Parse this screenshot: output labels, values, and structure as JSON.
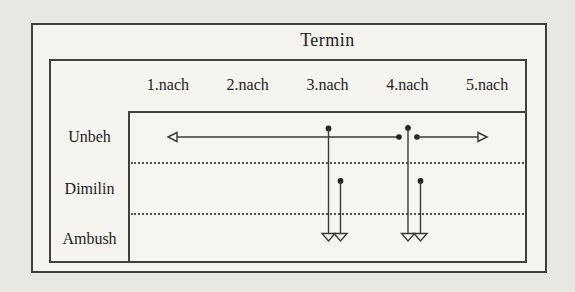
{
  "figure": {
    "title": "Termin",
    "columns": [
      "1.nach",
      "2.nach",
      "3.nach",
      "4.nach",
      "5.nach"
    ],
    "rows": [
      "Unbeh",
      "Dimilin",
      "Ambush"
    ]
  },
  "colors": {
    "line": "#3c3a38",
    "dot": "#252320",
    "page_bg": "#e9e7e2",
    "paper_bg": "#f4f3ee"
  },
  "diagram": {
    "horizontal_arrows": [
      {
        "name": "unbeh-span-left",
        "row": "Unbeh",
        "direction": "left",
        "y": 137,
        "x_tip": 168,
        "x_end": 399,
        "dot_at_end": true
      },
      {
        "name": "unbeh-span-right",
        "row": "Unbeh",
        "direction": "right",
        "y": 137,
        "x_start": 417,
        "x_tip": 487,
        "dot_at_start": true
      }
    ],
    "vertical_arrows": [
      {
        "name": "unbeh-to-ambush-3nach",
        "column": "3.nach",
        "x": 328.5,
        "y_top": 128.5,
        "y_tip": 241
      },
      {
        "name": "dimilin-to-ambush-3nach",
        "column": "3.nach",
        "x": 340.5,
        "y_top": 181,
        "y_tip": 241
      },
      {
        "name": "unbeh-to-ambush-4nach",
        "column": "4.nach",
        "x": 408,
        "y_top": 128,
        "y_tip": 241
      },
      {
        "name": "dimilin-to-ambush-4nach",
        "column": "4.nach",
        "x": 420.5,
        "y_top": 181,
        "y_tip": 241
      }
    ]
  }
}
